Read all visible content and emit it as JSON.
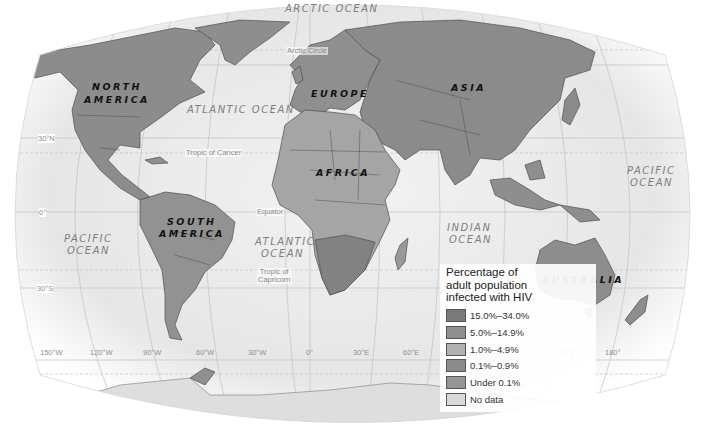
{
  "map": {
    "title": "Percentage of adult population infected with HIV",
    "oceans": [
      {
        "id": "arctic",
        "text": "ARCTIC OCEAN",
        "x": 285,
        "y": 3
      },
      {
        "id": "atlantic-north",
        "text": "ATLANTIC OCEAN",
        "x": 187,
        "y": 104
      },
      {
        "id": "atlantic-south-1",
        "text": "ATLANTIC",
        "x": 255,
        "y": 236
      },
      {
        "id": "atlantic-south-2",
        "text": "OCEAN",
        "x": 261,
        "y": 248
      },
      {
        "id": "pacific-west-1",
        "text": "PACIFIC",
        "x": 64,
        "y": 233
      },
      {
        "id": "pacific-west-2",
        "text": "OCEAN",
        "x": 67,
        "y": 245
      },
      {
        "id": "pacific-east-1",
        "text": "PACIFIC",
        "x": 627,
        "y": 165
      },
      {
        "id": "pacific-east-2",
        "text": "OCEAN",
        "x": 630,
        "y": 177
      },
      {
        "id": "indian-1",
        "text": "INDIAN",
        "x": 447,
        "y": 222
      },
      {
        "id": "indian-2",
        "text": "OCEAN",
        "x": 449,
        "y": 234
      }
    ],
    "continents": [
      {
        "id": "north-america-1",
        "text": "NORTH",
        "x": 92,
        "y": 81
      },
      {
        "id": "north-america-2",
        "text": "AMERICA",
        "x": 84,
        "y": 94
      },
      {
        "id": "europe",
        "text": "EUROPE",
        "x": 311,
        "y": 88
      },
      {
        "id": "asia",
        "text": "ASIA",
        "x": 451,
        "y": 82
      },
      {
        "id": "africa",
        "text": "AFRICA",
        "x": 316,
        "y": 167
      },
      {
        "id": "south-america-1",
        "text": "SOUTH",
        "x": 167,
        "y": 216
      },
      {
        "id": "south-america-2",
        "text": "AMERICA",
        "x": 159,
        "y": 228
      },
      {
        "id": "australia",
        "text": "AUSTRALIA",
        "x": 542,
        "y": 274
      }
    ],
    "line_labels": [
      {
        "id": "arctic-circle",
        "text": "Arctic Circle",
        "x": 286,
        "y": 47
      },
      {
        "id": "tropic-cancer",
        "text": "Tropic of Cancer",
        "x": 185,
        "y": 149
      },
      {
        "id": "equator",
        "text": "Equator",
        "x": 256,
        "y": 208
      },
      {
        "id": "tropic-capricorn",
        "text": "Tropic of\nCapricorn",
        "x": 257,
        "y": 268
      }
    ],
    "lat_labels": [
      {
        "text": "30°N",
        "x": 38,
        "y": 135
      },
      {
        "text": "0°",
        "x": 39,
        "y": 208
      },
      {
        "text": "30°S",
        "x": 37,
        "y": 284
      }
    ],
    "lon_labels": [
      {
        "text": "150°W",
        "x": 40,
        "y": 348
      },
      {
        "text": "120°W",
        "x": 90,
        "y": 348
      },
      {
        "text": "90°W",
        "x": 143,
        "y": 348
      },
      {
        "text": "60°W",
        "x": 196,
        "y": 348
      },
      {
        "text": "30°W",
        "x": 248,
        "y": 348
      },
      {
        "text": "0°",
        "x": 306,
        "y": 348
      },
      {
        "text": "30°E",
        "x": 353,
        "y": 348
      },
      {
        "text": "60°E",
        "x": 403,
        "y": 348
      },
      {
        "text": "150°E",
        "x": 555,
        "y": 348
      },
      {
        "text": "180°",
        "x": 605,
        "y": 348
      }
    ]
  },
  "legend": {
    "title_line1": "Percentage of",
    "title_line2": "adult population",
    "title_line3": "infected with HIV",
    "items": [
      {
        "label": "15.0%–34.0%",
        "color": "#7a7a7a"
      },
      {
        "label": "5.0%–14.9%",
        "color": "#8f8f8f"
      },
      {
        "label": "1.0%–4.9%",
        "color": "#b1b1b1"
      },
      {
        "label": "0.1%–0.9%",
        "color": "#8c8c8c"
      },
      {
        "label": "Under 0.1%",
        "color": "#959595"
      },
      {
        "label": "No data",
        "color": "#d8d8d8"
      }
    ]
  },
  "colors": {
    "ocean": "#ececec",
    "land": "#8e8e8e",
    "land_light": "#a9a9a9",
    "border": "#4f4f4f",
    "grid": "#bdbdbd"
  }
}
